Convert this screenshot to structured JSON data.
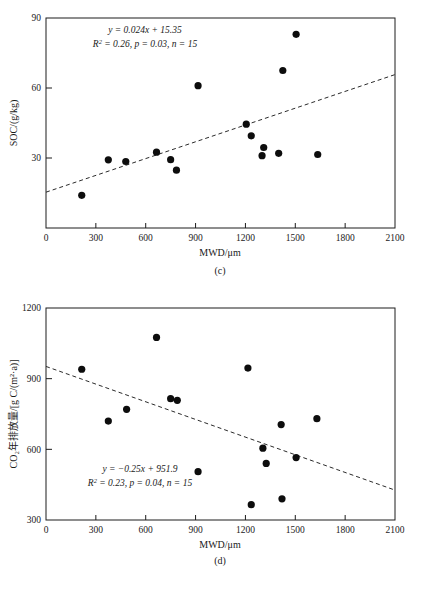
{
  "figure": {
    "panels": [
      {
        "tag": "(c)",
        "equation_line1": "y = 0.024x + 15.35",
        "equation_line2_r2": "R",
        "equation_line2_rest": " = 0.26, p = 0.03, n = 15"
      },
      {
        "tag": "(d)",
        "equation_line1": "y = −0.25x + 951.9",
        "equation_line2_r2": "R",
        "equation_line2_rest": " = 0.23, p = 0.04, n = 15"
      }
    ]
  },
  "chart_data": [
    {
      "type": "scatter",
      "title": "",
      "xlabel": "MWD/μm",
      "ylabel": "SOC/(g/kg)",
      "xlim": [
        0,
        2100
      ],
      "ylim": [
        0,
        90
      ],
      "xticks": [
        0,
        300,
        600,
        900,
        1200,
        1500,
        1800,
        2100
      ],
      "xticklabels": [
        "0",
        "300",
        "600",
        "900",
        "1200",
        "1500",
        "1800",
        "2100"
      ],
      "yticks": [
        30,
        60,
        90
      ],
      "yticklabels": [
        "30",
        "60",
        "90"
      ],
      "grid": false,
      "legend": "none",
      "panel_label": "(c)",
      "annotation_equation": "y = 0.024x + 15.35",
      "annotation_stats": "R² = 0.26, p = 0.03, n = 15",
      "slope": 0.024,
      "intercept": 15.35,
      "r_squared": 0.26,
      "p_value": 0.03,
      "n": 15,
      "points": [
        {
          "x": 215,
          "y": 14.0
        },
        {
          "x": 375,
          "y": 29.2
        },
        {
          "x": 480,
          "y": 28.5
        },
        {
          "x": 665,
          "y": 32.5
        },
        {
          "x": 750,
          "y": 29.3
        },
        {
          "x": 785,
          "y": 24.8
        },
        {
          "x": 915,
          "y": 61.0
        },
        {
          "x": 1205,
          "y": 44.5
        },
        {
          "x": 1235,
          "y": 39.5
        },
        {
          "x": 1310,
          "y": 34.5
        },
        {
          "x": 1300,
          "y": 31.0
        },
        {
          "x": 1400,
          "y": 32.0
        },
        {
          "x": 1425,
          "y": 67.5
        },
        {
          "x": 1505,
          "y": 83.0
        },
        {
          "x": 1635,
          "y": 31.5
        }
      ]
    },
    {
      "type": "scatter",
      "title": "",
      "xlabel": "MWD/μm",
      "ylabel": "CO₂年排放量/[g C/(m²·a)]",
      "xlim": [
        0,
        2100
      ],
      "ylim": [
        300,
        1200
      ],
      "xticks": [
        0,
        300,
        600,
        900,
        1200,
        1500,
        1800,
        2100
      ],
      "xticklabels": [
        "0",
        "300",
        "600",
        "900",
        "1200",
        "1500",
        "1800",
        "2100"
      ],
      "yticks": [
        300,
        600,
        900,
        1200
      ],
      "yticklabels": [
        "300",
        "600",
        "900",
        "1200"
      ],
      "grid": false,
      "legend": "none",
      "panel_label": "(d)",
      "annotation_equation": "y = −0.25x + 951.9",
      "annotation_stats": "R² = 0.23, p = 0.04, n = 15",
      "slope": -0.25,
      "intercept": 951.9,
      "r_squared": 0.23,
      "p_value": 0.04,
      "n": 15,
      "points": [
        {
          "x": 215,
          "y": 940
        },
        {
          "x": 375,
          "y": 720
        },
        {
          "x": 485,
          "y": 770
        },
        {
          "x": 665,
          "y": 1075
        },
        {
          "x": 750,
          "y": 815
        },
        {
          "x": 790,
          "y": 808
        },
        {
          "x": 915,
          "y": 505
        },
        {
          "x": 1215,
          "y": 945
        },
        {
          "x": 1235,
          "y": 365
        },
        {
          "x": 1305,
          "y": 605
        },
        {
          "x": 1325,
          "y": 540
        },
        {
          "x": 1415,
          "y": 705
        },
        {
          "x": 1420,
          "y": 390
        },
        {
          "x": 1505,
          "y": 565
        },
        {
          "x": 1630,
          "y": 730
        }
      ]
    }
  ]
}
